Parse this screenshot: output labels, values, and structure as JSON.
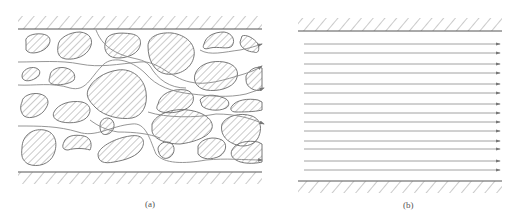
{
  "figure": {
    "panels": [
      {
        "id": "a",
        "label": "(a)",
        "description": "Flow through porous medium: irregular hatched particles between two hatched walls, with tortuous streamlines winding through pores and exiting with arrows on the right"
      },
      {
        "id": "b",
        "label": "(b)",
        "description": "Equivalent idealized flow: parallel straight streamlines with arrows between two hatched walls",
        "streamline_count": 14
      }
    ],
    "colors": {
      "line": "#6a6a6a",
      "hatch": "#7a7a7a",
      "streamline": "#8a8a8a",
      "background": "#ffffff"
    }
  }
}
